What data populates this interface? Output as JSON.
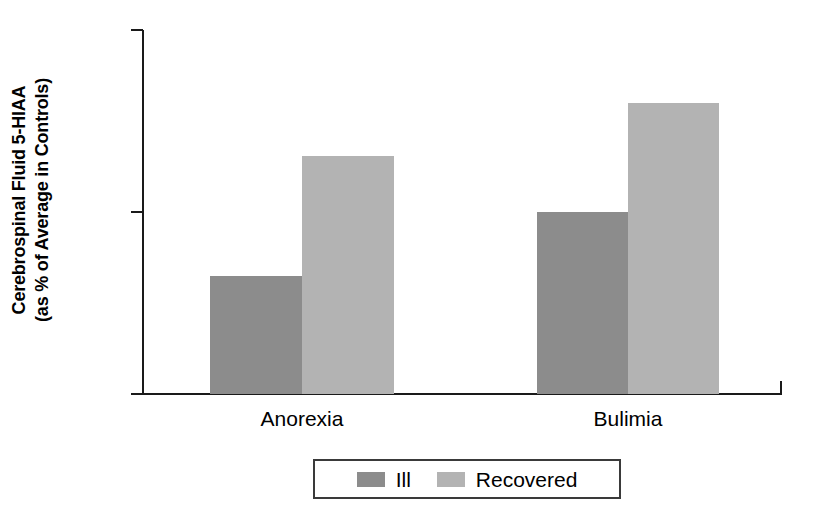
{
  "chart_data": {
    "type": "bar",
    "title": "",
    "subtitle": "",
    "xlabel": "",
    "ylabel": "Cerebrospinal Fluid 5-HIAA (as % of Average in Controls)",
    "ylabel_lines": [
      "Cerebrospinal Fluid 5-HIAA",
      "(as % of Average in Controls)"
    ],
    "categories": [
      "Anorexia",
      "Bulimia"
    ],
    "series": [
      {
        "name": "Ill",
        "color": "#8c8c8c",
        "values": [
          65,
          100
        ]
      },
      {
        "name": "Recovered",
        "color": "#b3b3b3",
        "values": [
          131,
          160
        ]
      }
    ],
    "ylim": [
      0,
      200
    ],
    "yticks": [
      0,
      100,
      200
    ],
    "ytick_labels": [
      "0",
      "100",
      "200"
    ],
    "grid": false,
    "legend_position": "bottom",
    "legend_entries": [
      {
        "label": "Ill",
        "color": "#8c8c8c"
      },
      {
        "label": "Recovered",
        "color": "#b3b3b3"
      }
    ]
  },
  "axis": {
    "y_tick_0": "0",
    "y_tick_100": "100",
    "y_tick_200": "200"
  },
  "categories": {
    "first": "Anorexia",
    "second": "Bulimia"
  },
  "legend": {
    "ill_label": "Ill",
    "recovered_label": "Recovered"
  },
  "colors": {
    "ill": "#8c8c8c",
    "recovered": "#b3b3b3",
    "axis": "#1a1a1a",
    "text": "#000000",
    "background": "#ffffff"
  }
}
